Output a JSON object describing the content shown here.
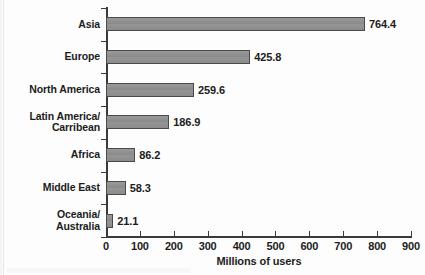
{
  "chart_data": {
    "type": "bar",
    "orientation": "horizontal",
    "title": "",
    "xlabel": "Millions of users",
    "ylabel": "",
    "xlim": [
      0,
      900
    ],
    "xticks": [
      0,
      100,
      200,
      300,
      400,
      500,
      600,
      700,
      800,
      900
    ],
    "grid": false,
    "legend": null,
    "categories": [
      "Asia",
      "Europe",
      "North America",
      "Latin America/\nCarribean",
      "Africa",
      "Middle East",
      "Oceania/\nAustralia"
    ],
    "values": [
      764.4,
      425.8,
      259.6,
      186.9,
      86.2,
      58.3,
      21.1
    ],
    "value_labels": [
      "764.4",
      "425.8",
      "259.6",
      "186.9",
      "86.2",
      "58.3",
      "21.1"
    ],
    "bars": [
      {
        "category": "Asia",
        "category_lines": [
          "Asia"
        ],
        "value": 764.4,
        "label": "764.4"
      },
      {
        "category": "Europe",
        "category_lines": [
          "Europe"
        ],
        "value": 425.8,
        "label": "425.8"
      },
      {
        "category": "North America",
        "category_lines": [
          "North America"
        ],
        "value": 259.6,
        "label": "259.6"
      },
      {
        "category": "Latin America/Carribean",
        "category_lines": [
          "Latin America/",
          "Carribean"
        ],
        "value": 186.9,
        "label": "186.9"
      },
      {
        "category": "Africa",
        "category_lines": [
          "Africa"
        ],
        "value": 86.2,
        "label": "86.2"
      },
      {
        "category": "Middle East",
        "category_lines": [
          "Middle East"
        ],
        "value": 58.3,
        "label": "58.3"
      },
      {
        "category": "Oceania/Australia",
        "category_lines": [
          "Oceania/",
          "Australia"
        ],
        "value": 21.1,
        "label": "21.1"
      }
    ],
    "colors": {
      "bar_fill": "#8e8e8e",
      "bar_border": "#4a4a4a",
      "axis": "#3a3a3a",
      "text": "#1c1c1c",
      "background": "#fdfdfd"
    }
  }
}
